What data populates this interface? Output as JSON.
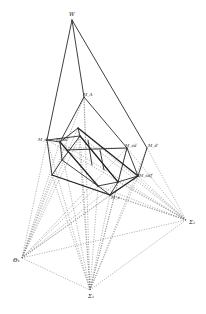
{
  "figure": {
    "background": "#ffffff",
    "line_color": "#2a2a2a",
    "dashed_color": "#6a6a6a"
  },
  "labels": {
    "apex": "W",
    "top_inner": "M_A",
    "left": "M_d",
    "left_inner": "M_ad",
    "right_inner": "M_cd",
    "right": "M_d'",
    "right_lower": "M_cdf",
    "bottom": "M_c",
    "centre_left": "Θ₁",
    "centre_bottom": "Σ₁",
    "centre_right": "Σ₂"
  },
  "points": {
    "apex": [
      72,
      20
    ],
    "top_inner": [
      84,
      97
    ],
    "left": [
      47,
      140
    ],
    "left_inner": [
      60,
      142
    ],
    "mid_a": [
      78,
      128
    ],
    "mid_b": [
      80,
      136
    ],
    "right_inner": [
      127,
      148
    ],
    "right": [
      147,
      148
    ],
    "right_lower": [
      138,
      176
    ],
    "bottom": [
      110,
      195
    ],
    "bottom_left": [
      52,
      175
    ],
    "inner_c": [
      98,
      186
    ],
    "inner_d": [
      118,
      182
    ],
    "centre_left": [
      22,
      258
    ],
    "centre_bottom": [
      90,
      290
    ],
    "centre_right": [
      186,
      220
    ]
  }
}
